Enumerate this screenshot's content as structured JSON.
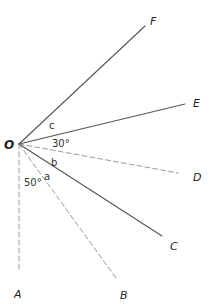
{
  "diagram": {
    "vertex": {
      "label": "O",
      "x": 19,
      "y": 144
    },
    "rays": [
      {
        "id": "A",
        "label": "A",
        "end": [
          19,
          272
        ],
        "faint": true,
        "label_pos": [
          14,
          298
        ]
      },
      {
        "id": "B",
        "label": "B",
        "end": [
          116,
          278
        ],
        "faint": true,
        "label_pos": [
          120,
          299
        ]
      },
      {
        "id": "C",
        "label": "C",
        "end": [
          162,
          236
        ],
        "faint": false,
        "label_pos": [
          170,
          250
        ]
      },
      {
        "id": "D",
        "label": "D",
        "end": [
          178,
          173
        ],
        "faint": true,
        "label_pos": [
          193,
          181
        ]
      },
      {
        "id": "E",
        "label": "E",
        "end": [
          185,
          104
        ],
        "faint": false,
        "label_pos": [
          193,
          107
        ]
      },
      {
        "id": "F",
        "label": "F",
        "end": [
          145,
          26
        ],
        "faint": false,
        "label_pos": [
          150,
          25
        ]
      }
    ],
    "angle_labels": [
      {
        "id": "c",
        "text": "c",
        "pos": [
          49,
          129
        ]
      },
      {
        "id": "30deg",
        "text": "30°",
        "pos": [
          52,
          147
        ]
      },
      {
        "id": "b",
        "text": "b",
        "pos": [
          51,
          166
        ]
      },
      {
        "id": "a",
        "text": "a",
        "pos": [
          44,
          180
        ]
      },
      {
        "id": "50deg",
        "text": "50°",
        "pos": [
          24,
          186
        ]
      }
    ],
    "colors": {
      "line": "#555555",
      "faint_line": "#9a9a9a",
      "text": "#222222"
    }
  }
}
